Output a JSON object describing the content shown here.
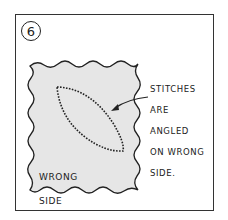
{
  "figure": {
    "step_number": "6",
    "callout_lines": [
      "STITCHES",
      "ARE",
      "ANGLED",
      "ON WRONG",
      "SIDE."
    ],
    "fabric_label_lines": [
      "WRONG",
      "SIDE"
    ],
    "colors": {
      "fabric_fill": "#e6e6e6",
      "ink": "#222222",
      "background": "#ffffff"
    }
  }
}
